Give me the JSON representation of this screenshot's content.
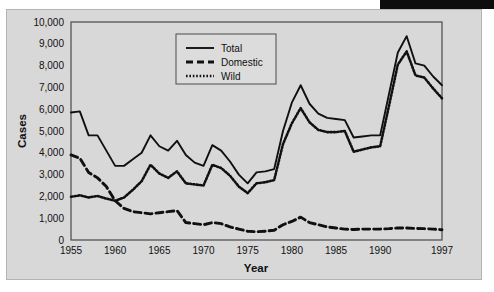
{
  "figure": {
    "background_color": "#d8d8d8",
    "page_color": "#ffffff",
    "band_color": "#0d0d0d",
    "plot_border_color": "#4a4a4a",
    "line_color": "#101010"
  },
  "axis": {
    "y_title": "Cases",
    "x_title": "Year"
  },
  "legend": {
    "items": [
      {
        "label": "Total",
        "style": "solid"
      },
      {
        "label": "Domestic",
        "style": "dashed"
      },
      {
        "label": "Wild",
        "style": "dotted"
      }
    ]
  },
  "chart_data": {
    "type": "line",
    "title": "",
    "subtitle": "",
    "xlabel": "Year",
    "ylabel": "Cases",
    "xlim": [
      1955,
      1997
    ],
    "ylim": [
      0,
      10000
    ],
    "grid": false,
    "legend_position": "top-center",
    "xticks": [
      1955,
      1960,
      1965,
      1970,
      1975,
      1980,
      1985,
      1990,
      1997
    ],
    "xtick_labels": [
      "1955",
      "1960",
      "1965",
      "1970",
      "1975",
      "1980",
      "1985",
      "1990",
      "1997"
    ],
    "yticks": [
      0,
      1000,
      2000,
      3000,
      4000,
      5000,
      6000,
      7000,
      8000,
      9000,
      10000
    ],
    "ytick_labels": [
      "0",
      "1,000",
      "2,000",
      "3,000",
      "4,000",
      "5,000",
      "6,000",
      "7,000",
      "8,000",
      "9,000",
      "10,000"
    ],
    "x": [
      1955,
      1956,
      1957,
      1958,
      1959,
      1960,
      1961,
      1962,
      1963,
      1964,
      1965,
      1966,
      1967,
      1968,
      1969,
      1970,
      1971,
      1972,
      1973,
      1974,
      1975,
      1976,
      1977,
      1978,
      1979,
      1980,
      1981,
      1982,
      1983,
      1984,
      1985,
      1986,
      1987,
      1988,
      1989,
      1990,
      1991,
      1992,
      1993,
      1994,
      1995,
      1996,
      1997
    ],
    "series": [
      {
        "name": "Total",
        "style": "solid",
        "values": [
          5850,
          5900,
          4800,
          4800,
          4100,
          3400,
          3400,
          3700,
          4000,
          4800,
          4300,
          4100,
          4550,
          3900,
          3550,
          3400,
          4350,
          4100,
          3600,
          3000,
          2600,
          3100,
          3150,
          3250,
          5000,
          6300,
          7100,
          6250,
          5800,
          5600,
          5550,
          5500,
          4700,
          4750,
          4800,
          4800,
          6700,
          8600,
          9350,
          8100,
          8000,
          7500,
          7100
        ]
      },
      {
        "name": "Domestic",
        "style": "dashed",
        "values": [
          3900,
          3750,
          3100,
          2850,
          2450,
          1800,
          1450,
          1300,
          1250,
          1200,
          1250,
          1300,
          1350,
          800,
          750,
          700,
          800,
          750,
          600,
          500,
          400,
          380,
          400,
          450,
          700,
          850,
          1050,
          800,
          700,
          600,
          550,
          500,
          480,
          500,
          500,
          500,
          520,
          550,
          550,
          530,
          520,
          500,
          470
        ]
      },
      {
        "name": "Wild",
        "style": "dotted",
        "values": [
          1980,
          2050,
          1950,
          2020,
          1900,
          1800,
          1950,
          2300,
          2700,
          3450,
          3050,
          2850,
          3150,
          2600,
          2550,
          2500,
          3450,
          3300,
          2950,
          2450,
          2150,
          2600,
          2650,
          2750,
          4400,
          5350,
          6050,
          5400,
          5050,
          4950,
          4950,
          5000,
          4050,
          4150,
          4250,
          4300,
          6150,
          8050,
          8650,
          7550,
          7450,
          6950,
          6500
        ]
      }
    ]
  }
}
